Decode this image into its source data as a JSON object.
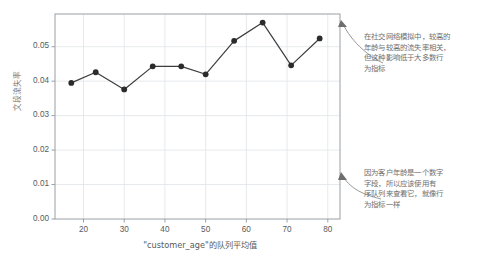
{
  "chart_data": {
    "type": "line",
    "title": "",
    "xlabel": "\"customer_age\"的队列平均值",
    "ylabel": "文段流失率",
    "xlim": [
      13,
      83
    ],
    "ylim": [
      0,
      0.0595
    ],
    "grid": true,
    "legend": null,
    "xticks": [
      "20",
      "30",
      "40",
      "50",
      "60",
      "70",
      "80"
    ],
    "xtick_values": [
      20,
      30,
      40,
      50,
      60,
      70,
      80
    ],
    "yticks": [
      "0.00",
      "0.01",
      "0.02",
      "0.03",
      "0.04",
      "0.05"
    ],
    "ytick_values": [
      0.0,
      0.01,
      0.02,
      0.03,
      0.04,
      0.05
    ],
    "series": [
      {
        "name": "churn rate",
        "color": "#3d3d3d",
        "marker": "circle",
        "x": [
          17,
          23,
          30,
          37,
          44,
          50,
          57,
          64,
          71,
          78
        ],
        "values": [
          0.0395,
          0.0426,
          0.0376,
          0.0443,
          0.0443,
          0.042,
          0.0517,
          0.057,
          0.0446,
          0.0524
        ]
      }
    ]
  },
  "annotations": [
    {
      "id": "annotation-top",
      "text": "在社交网络模拟中，较高的\n年龄与较高的流失率相关，\n但这种影响低于大多数行\n为指标",
      "color": "#6e6e6e",
      "arrow_target": "plot-right-edge-upper"
    },
    {
      "id": "annotation-bottom",
      "text": "因为客户年龄是一个数字\n字段，所以应该使用有\n序队列来查看它，就像行\n为指标一样",
      "color": "#6e6e6e",
      "arrow_target": "plot-right-edge-lower"
    }
  ],
  "style": {
    "background": "#ffffff",
    "grid_color": "#e3e6ea",
    "axis_color": "#9aa0a6",
    "line_color": "#3d3d3d",
    "marker_color": "#2b2b2b",
    "tick_text_color": "#5a5a5a",
    "annotation_color": "#6e6e6e"
  }
}
